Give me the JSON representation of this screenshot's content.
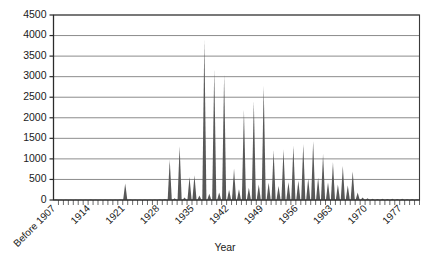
{
  "chart_data": {
    "type": "bar",
    "title": "",
    "xlabel": "Year",
    "ylabel": "",
    "ylim": [
      0,
      4500
    ],
    "ytick_step": 500,
    "yticks": [
      0,
      500,
      1000,
      1500,
      2000,
      2500,
      3000,
      3500,
      4000,
      4500
    ],
    "ytick_labels": [
      "0",
      "500",
      "1000",
      "1500",
      "2000",
      "2500",
      "3000",
      "3500",
      "4000",
      "4500"
    ],
    "grid": true,
    "legend": null,
    "xtick_labels": [
      "Before 1907",
      "1914",
      "1921",
      "1928",
      "1935",
      "1942",
      "1949",
      "1956",
      "1963",
      "1970",
      "1977"
    ],
    "xtick_categories": [
      "Before 1907",
      "1914",
      "1921",
      "1928",
      "1935",
      "1942",
      "1949",
      "1956",
      "1963",
      "1970",
      "1977"
    ],
    "x_first_category": "Before 1907",
    "x_category_step_years": 1,
    "x_label_step_years": 7,
    "bar_color": "#585858",
    "categories": [
      "Before 1907",
      "1908",
      "1909",
      "1910",
      "1911",
      "1912",
      "1913",
      "1914",
      "1915",
      "1916",
      "1917",
      "1918",
      "1919",
      "1920",
      "1921",
      "1922",
      "1923",
      "1924",
      "1925",
      "1926",
      "1927",
      "1928",
      "1929",
      "1930",
      "1931",
      "1932",
      "1933",
      "1934",
      "1935",
      "1936",
      "1937",
      "1938",
      "1939",
      "1940",
      "1941",
      "1942",
      "1943",
      "1944",
      "1945",
      "1946",
      "1947",
      "1948",
      "1949",
      "1950",
      "1951",
      "1952",
      "1953",
      "1954",
      "1955",
      "1956",
      "1957",
      "1958",
      "1959",
      "1960",
      "1961",
      "1962",
      "1963",
      "1964",
      "1965",
      "1966",
      "1967",
      "1968",
      "1969",
      "1970",
      "1971",
      "1972",
      "1973",
      "1974",
      "1975",
      "1976",
      "1977",
      "1978",
      "1979",
      "1980"
    ],
    "values": [
      15,
      5,
      5,
      5,
      8,
      5,
      5,
      10,
      5,
      5,
      5,
      5,
      5,
      10,
      400,
      10,
      5,
      5,
      5,
      5,
      5,
      10,
      20,
      980,
      40,
      1310,
      60,
      560,
      600,
      110,
      3900,
      150,
      3180,
      180,
      3060,
      250,
      760,
      260,
      2200,
      300,
      2400,
      380,
      2780,
      420,
      1210,
      340,
      1230,
      430,
      1320,
      470,
      1360,
      520,
      1430,
      540,
      1120,
      430,
      920,
      380,
      830,
      350,
      700,
      180,
      60,
      40,
      30,
      25,
      30,
      25,
      30,
      25,
      30,
      20,
      20,
      15
    ]
  }
}
